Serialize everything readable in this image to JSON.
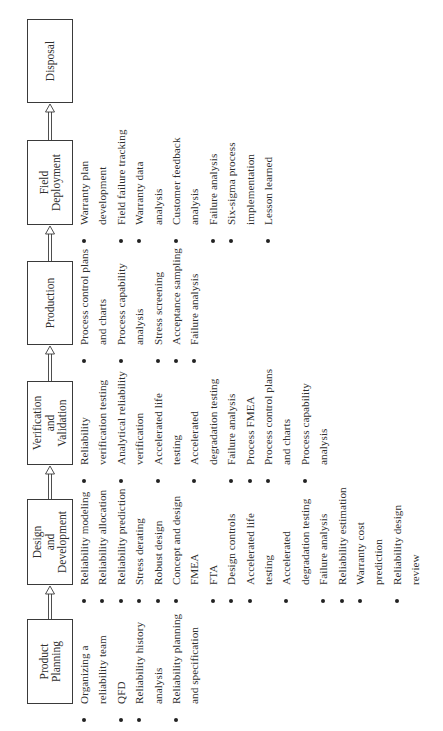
{
  "diagram": {
    "orientation": "rotated 90 degrees counter-clockwise",
    "stages": [
      {
        "label": "Product\nPlanning",
        "tasks": [
          [
            "Organizing a",
            "reliability team"
          ],
          [
            "QFD"
          ],
          [
            "Reliability history",
            "analysis"
          ],
          [
            "Reliability planning",
            "and specification"
          ]
        ]
      },
      {
        "label": "Design\nand\nDevelopment",
        "tasks": [
          [
            "Reliability modeling"
          ],
          [
            "Reliability allocation"
          ],
          [
            "Reliability prediction"
          ],
          [
            "Stress derating"
          ],
          [
            "Robust design"
          ],
          [
            "Concept and design",
            "FMEA"
          ],
          [
            "FTA"
          ],
          [
            "Design controls"
          ],
          [
            "Accelerated life",
            "testing"
          ],
          [
            "Accelerated",
            "degradation testing"
          ],
          [
            "Failure analysis"
          ],
          [
            "Reliability estimation"
          ],
          [
            "Warranty cost",
            "prediction"
          ],
          [
            "Reliability design",
            "review"
          ]
        ]
      },
      {
        "label": "Verification\nand\nValidation",
        "tasks": [
          [
            "Reliability",
            "verification testing"
          ],
          [
            "Analytical reliability",
            "verification"
          ],
          [
            "Accelerated life",
            "testing"
          ],
          [
            "Accelerated",
            "degradation testing"
          ],
          [
            "Failure analysis"
          ],
          [
            "Process FMEA"
          ],
          [
            "Process control plans",
            "and charts"
          ],
          [
            "Process capability",
            "analysis"
          ]
        ]
      },
      {
        "label": "Production",
        "tasks": [
          [
            "Process control plans",
            "and charts"
          ],
          [
            "Process capability",
            "analysis"
          ],
          [
            "Stress screening"
          ],
          [
            "Acceptance sampling"
          ],
          [
            "Failure analysis"
          ]
        ]
      },
      {
        "label": "Field\nDeployment",
        "tasks": [
          [
            "Warranty plan",
            "development"
          ],
          [
            "Field failure tracking"
          ],
          [
            "Warranty data",
            "analysis"
          ],
          [
            "Customer feedback",
            "analysis"
          ],
          [
            "Failure analysis"
          ],
          [
            "Six-sigma process",
            "implementation"
          ],
          [
            "Lesson learned"
          ]
        ]
      },
      {
        "label": "Disposal",
        "tasks": []
      }
    ],
    "colors": {
      "line": "#3a3a3a",
      "text": "#2e2e2e",
      "background": "#ffffff"
    }
  }
}
